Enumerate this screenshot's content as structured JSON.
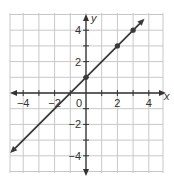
{
  "chart_data": {
    "type": "line",
    "title": "",
    "xlabel": "x",
    "ylabel": "y",
    "xlim": [
      -5,
      5
    ],
    "ylim": [
      -5,
      5
    ],
    "grid": true,
    "xticks": [
      -4,
      -2,
      0,
      2,
      4
    ],
    "yticks": [
      -4,
      -2,
      2,
      4
    ],
    "tick_labels": {
      "x": [
        "-4",
        "-2",
        "0",
        "2",
        "4"
      ],
      "y": [
        "4",
        "2",
        "-2",
        "-4"
      ]
    },
    "series": [
      {
        "name": "y = x + 1",
        "equation": "y = x + 1",
        "line_endpoints": [
          [
            -4.7,
            -3.7
          ],
          [
            3.6,
            4.6
          ]
        ],
        "arrows_both_ends": true,
        "points": [
          [
            0,
            1
          ],
          [
            2,
            3
          ],
          [
            3,
            4
          ]
        ],
        "color": "#333333"
      }
    ],
    "legend": null
  },
  "colors": {
    "grid": "#c8c8c8",
    "axis": "#333333",
    "line": "#3a3a3a"
  }
}
